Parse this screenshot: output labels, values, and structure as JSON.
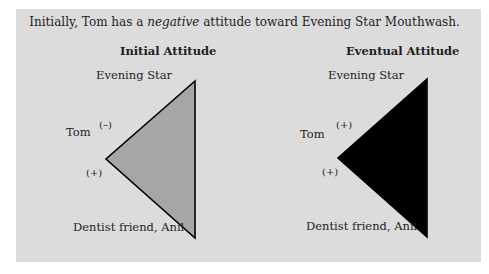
{
  "title": {
    "before": "Initially, Tom has a ",
    "emphasis": "negative",
    "after": " attitude toward Evening Star Mouthwash."
  },
  "colors": {
    "panel_bg": "#dcdcdc",
    "initial_fill": "#a6a6a6",
    "eventual_fill": "#000000",
    "stroke": "#000000"
  },
  "diagrams": [
    {
      "header": "Initial Attitude",
      "top_label": "Evening Star",
      "left_label": "Tom",
      "bottom_label": "Dentist friend, Anil",
      "upper_sign": "(–)",
      "lower_sign": "(+)",
      "fill": "gray"
    },
    {
      "header": "Eventual Attitude",
      "top_label": "Evening Star",
      "left_label": "Tom",
      "bottom_label": "Dentist friend, Anil",
      "upper_sign": "(+)",
      "lower_sign": "(+)",
      "fill": "black"
    }
  ]
}
